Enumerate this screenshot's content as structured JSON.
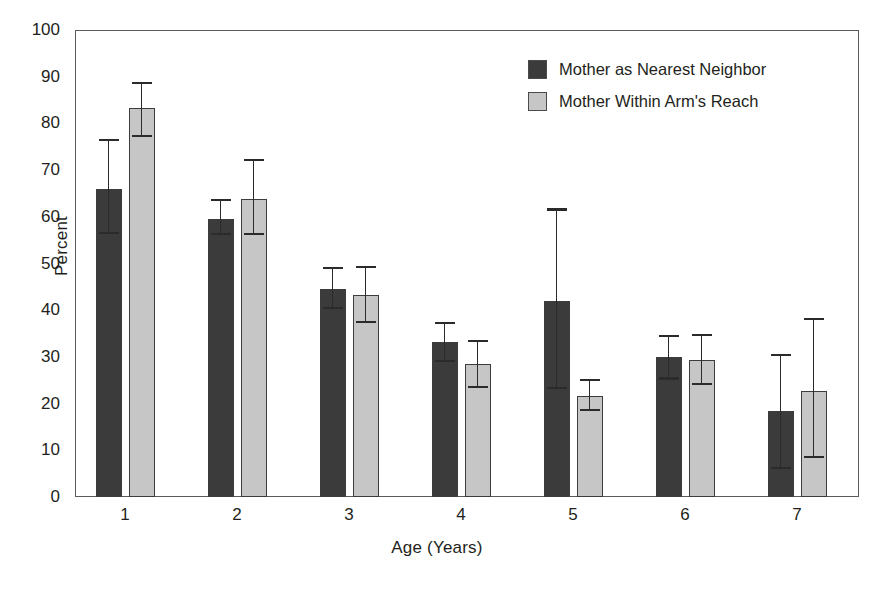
{
  "chart_data": {
    "type": "bar",
    "title": "",
    "subtitle": "",
    "xlabel": "Age (Years)",
    "ylabel": "Percent",
    "categories": [
      "1",
      "2",
      "3",
      "4",
      "5",
      "6",
      "7"
    ],
    "ylim": [
      0,
      100
    ],
    "yticks": [
      0,
      10,
      20,
      30,
      40,
      50,
      60,
      70,
      80,
      90,
      100
    ],
    "grid": false,
    "legend_position": "top-right",
    "error_bars": "asymmetric ranges shown as whisker caps",
    "series": [
      {
        "name": "Mother as Nearest Neighbor",
        "color": "#3b3b3b",
        "values": [
          66.0,
          59.6,
          44.5,
          33.2,
          41.9,
          29.9,
          18.4
        ],
        "err_high": [
          76.4,
          63.6,
          49.0,
          37.3,
          61.6,
          34.5,
          30.5
        ],
        "err_low": [
          56.6,
          56.3,
          40.5,
          29.1,
          23.4,
          25.4,
          6.3
        ]
      },
      {
        "name": "Mother Within Arm's Reach",
        "color": "#c6c6c6",
        "values": [
          83.4,
          63.9,
          43.3,
          28.4,
          21.6,
          29.4,
          22.6
        ],
        "err_high": [
          88.7,
          72.1,
          49.2,
          33.4,
          25.0,
          34.7,
          38.2
        ],
        "err_low": [
          77.4,
          56.3,
          37.5,
          23.5,
          18.6,
          24.2,
          8.5
        ]
      }
    ]
  },
  "legend": {
    "items": [
      {
        "label": "Mother as Nearest Neighbor",
        "color": "#3b3b3b"
      },
      {
        "label": "Mother Within Arm's Reach",
        "color": "#c6c6c6"
      }
    ]
  },
  "axes": {
    "y_title": "Percent",
    "x_title": "Age (Years)",
    "y_tick_labels": [
      "100",
      "90",
      "80",
      "70",
      "60",
      "50",
      "40",
      "30",
      "20",
      "10",
      "0"
    ],
    "x_tick_labels": [
      "1",
      "2",
      "3",
      "4",
      "5",
      "6",
      "7"
    ]
  }
}
